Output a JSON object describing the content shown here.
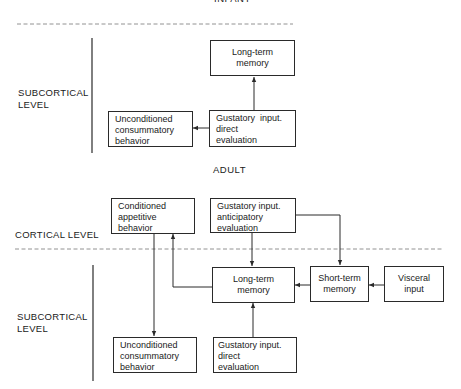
{
  "infant": {
    "title": "INFANT",
    "level_label": [
      "SUBCORTICAL",
      "LEVEL"
    ],
    "boxes": {
      "long_term_memory": [
        "Long-term",
        "memory"
      ],
      "unconditioned_behavior": [
        "Unconditioned",
        "consummatory",
        "behavior"
      ],
      "gustatory_direct": [
        "Gustatory  input.",
        "direct",
        "evaluation"
      ]
    }
  },
  "adult": {
    "title": "ADULT",
    "cortical_label": "CORTICAL LEVEL",
    "subcortical_label": [
      "SUBCORTICAL",
      "LEVEL"
    ],
    "boxes": {
      "conditioned_behavior": [
        "Conditioned",
        "appetitive",
        "behavior"
      ],
      "gustatory_anticipatory": [
        "Gustatory input.",
        "anticipatory",
        "evaluation"
      ],
      "long_term_memory": [
        "Long-term",
        "memory"
      ],
      "short_term_memory": [
        "Short-term",
        "memory"
      ],
      "visceral_input": [
        "Visceral",
        "input"
      ],
      "unconditioned_behavior": [
        "Unconditioned",
        "consummatory",
        "behavior"
      ],
      "gustatory_direct": [
        "Gustatory input.",
        "direct",
        "evaluation"
      ]
    }
  }
}
